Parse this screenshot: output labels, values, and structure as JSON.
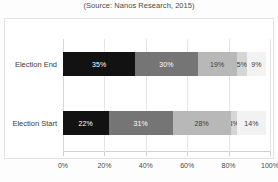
{
  "chart_data": {
    "type": "bar",
    "orientation": "horizontal",
    "stacked": true,
    "stacked_mode": "percent",
    "title": "",
    "subtitle": "(Source: Nanos Research, 2015)",
    "xlabel": "",
    "ylabel": "",
    "categories": [
      "Election End",
      "Election Start"
    ],
    "xlim": [
      0,
      100
    ],
    "xtick_labels": [
      "0%",
      "20%",
      "40%",
      "60%",
      "80%",
      "100%"
    ],
    "xtick_values": [
      0,
      20,
      40,
      60,
      80,
      100
    ],
    "grid": true,
    "grid_axis": "x",
    "legend": false,
    "legend_position": "none",
    "series": [
      {
        "name": "Segment 1",
        "color": "#121212",
        "label_color": "#ffffff",
        "values": [
          35,
          22
        ],
        "labels": [
          "35%",
          "22%"
        ]
      },
      {
        "name": "Segment 2",
        "color": "#757575",
        "label_color": "#ffffff",
        "values": [
          30,
          31
        ],
        "labels": [
          "30%",
          "31%"
        ]
      },
      {
        "name": "Segment 3",
        "color": "#b8b8b8",
        "label_color": "#3a3a3a",
        "values": [
          19,
          28
        ],
        "labels": [
          "19%",
          "28%"
        ]
      },
      {
        "name": "Segment 4",
        "color": "#d6d6d6",
        "label_color": "#3a3a3a",
        "values": [
          5,
          3
        ],
        "labels": [
          "5%",
          "3%"
        ]
      },
      {
        "name": "Segment 5",
        "color": "#f2f2f2",
        "label_color": "#3a3a3a",
        "values": [
          9,
          14
        ],
        "labels": [
          "9%",
          "14%"
        ]
      }
    ],
    "rows": [
      {
        "category": "Election End",
        "segments": [
          {
            "value": 35,
            "label": "35%",
            "color": "#121212",
            "label_color": "#ffffff"
          },
          {
            "value": 30,
            "label": "30%",
            "color": "#757575",
            "label_color": "#ffffff"
          },
          {
            "value": 19,
            "label": "19%",
            "color": "#b8b8b8",
            "label_color": "#3a3a3a"
          },
          {
            "value": 5,
            "label": "5%",
            "color": "#d6d6d6",
            "label_color": "#3a3a3a"
          },
          {
            "value": 9,
            "label": "9%",
            "color": "#f2f2f2",
            "label_color": "#3a3a3a"
          }
        ]
      },
      {
        "category": "Election Start",
        "segments": [
          {
            "value": 22,
            "label": "22%",
            "color": "#121212",
            "label_color": "#ffffff"
          },
          {
            "value": 31,
            "label": "31%",
            "color": "#757575",
            "label_color": "#ffffff"
          },
          {
            "value": 28,
            "label": "28%",
            "color": "#b8b8b8",
            "label_color": "#3a3a3a"
          },
          {
            "value": 3,
            "label": "3%",
            "color": "#d6d6d6",
            "label_color": "#3a3a3a"
          },
          {
            "value": 14,
            "label": "14%",
            "color": "#f2f2f2",
            "label_color": "#3a3a3a"
          }
        ]
      }
    ]
  }
}
